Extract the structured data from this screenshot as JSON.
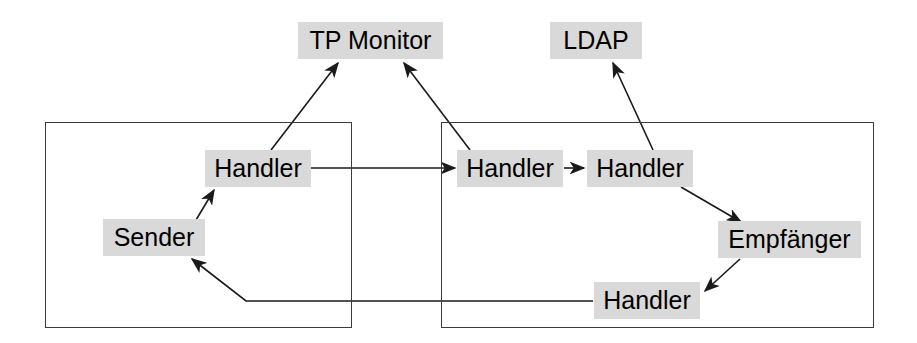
{
  "diagram": {
    "canvas": {
      "width": 917,
      "height": 343
    },
    "style": {
      "node_fill": "#d9d9d9",
      "node_text": "#000000",
      "container_stroke": "#3b3b3b",
      "edge_stroke": "#1a1a1a",
      "background": "#ffffff"
    },
    "containers": [
      {
        "id": "left-system",
        "label": "",
        "x": 45,
        "y": 122,
        "width": 307,
        "height": 206
      },
      {
        "id": "right-system",
        "label": "",
        "x": 441,
        "y": 122,
        "width": 433,
        "height": 206
      }
    ],
    "nodes": [
      {
        "id": "tp-monitor",
        "label": "TP Monitor",
        "x": 298,
        "y": 22,
        "width": 145,
        "height": 37
      },
      {
        "id": "ldap",
        "label": "LDAP",
        "x": 550,
        "y": 22,
        "width": 92,
        "height": 37
      },
      {
        "id": "handler-left",
        "label": "Handler",
        "x": 205,
        "y": 150,
        "width": 106,
        "height": 37
      },
      {
        "id": "sender",
        "label": "Sender",
        "x": 103,
        "y": 219,
        "width": 102,
        "height": 37
      },
      {
        "id": "handler-right-1",
        "label": "Handler",
        "x": 457,
        "y": 150,
        "width": 106,
        "height": 37
      },
      {
        "id": "handler-right-2",
        "label": "Handler",
        "x": 587,
        "y": 150,
        "width": 106,
        "height": 37
      },
      {
        "id": "empfaenger",
        "label": "Empfänger",
        "x": 718,
        "y": 221,
        "width": 143,
        "height": 37
      },
      {
        "id": "handler-bottom",
        "label": "Handler",
        "x": 594,
        "y": 282,
        "width": 106,
        "height": 37
      }
    ],
    "edges": [
      {
        "id": "sender-to-handler-left",
        "from": "sender",
        "to": "handler-left",
        "points": "196,220 214,190"
      },
      {
        "id": "handler-left-to-tp-monitor",
        "from": "handler-left",
        "to": "tp-monitor",
        "points": "271,150 338,63"
      },
      {
        "id": "handler-left-to-handler-right",
        "from": "handler-left",
        "to": "handler-right-1",
        "points": "311,168 455,168"
      },
      {
        "id": "handler-right-1-to-tp-monitor",
        "from": "handler-right-1",
        "to": "tp-monitor",
        "points": "470,150 404,63"
      },
      {
        "id": "handler-right-1-to-handler-2",
        "from": "handler-right-1",
        "to": "handler-right-2",
        "points": "564,168 584,168"
      },
      {
        "id": "handler-right-2-to-ldap",
        "from": "handler-right-2",
        "to": "ldap",
        "points": "653,150 613,63"
      },
      {
        "id": "handler-right-2-to-empfaenger",
        "from": "handler-right-2",
        "to": "empfaenger",
        "points": "681,187 741,222"
      },
      {
        "id": "empfaenger-to-handler-bottom",
        "from": "empfaenger",
        "to": "handler-bottom",
        "points": "740,259 705,291"
      },
      {
        "id": "handler-bottom-to-sender",
        "from": "handler-bottom",
        "to": "sender",
        "points": "593,301 246,301 192,259"
      }
    ]
  }
}
